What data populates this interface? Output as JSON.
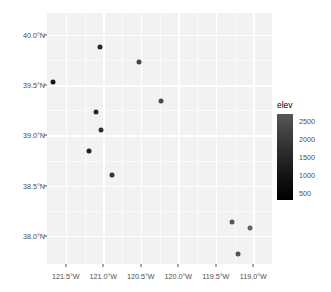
{
  "chart_data": {
    "type": "scatter",
    "title": "",
    "xlabel": "",
    "ylabel": "",
    "xlim": [
      -121.75,
      -118.75
    ],
    "ylim": [
      37.72,
      40.22
    ],
    "grid": true,
    "x_ticks": [
      {
        "value": -121.5,
        "label": "121.5°W"
      },
      {
        "value": -121.0,
        "label": "121.0°W"
      },
      {
        "value": -120.5,
        "label": "120.5°W"
      },
      {
        "value": -120.0,
        "label": "120.0°W"
      },
      {
        "value": -119.5,
        "label": "119.5°W"
      },
      {
        "value": -119.0,
        "label": "119.0°W"
      }
    ],
    "y_ticks": [
      {
        "value": 40.0,
        "label": "40.0°N"
      },
      {
        "value": 39.5,
        "label": "39.5°N"
      },
      {
        "value": 39.0,
        "label": "39.0°N"
      },
      {
        "value": 38.5,
        "label": "38.5°N"
      },
      {
        "value": 38.0,
        "label": "38.0°N"
      }
    ],
    "x_minor_ticks": [
      -121.25,
      -120.75,
      -120.25,
      -119.75,
      -119.25
    ],
    "y_minor_ticks": [
      39.75,
      39.25,
      38.75,
      38.25
    ],
    "points": [
      {
        "x": -121.04,
        "y": 39.88,
        "elev": 900,
        "color": "#2b2b2b"
      },
      {
        "x": -120.52,
        "y": 39.73,
        "elev": 1500,
        "color": "#444444"
      },
      {
        "x": -121.67,
        "y": 39.53,
        "elev": 500,
        "color": "#171717"
      },
      {
        "x": -120.23,
        "y": 39.34,
        "elev": 1700,
        "color": "#4a4a4a"
      },
      {
        "x": -121.1,
        "y": 39.23,
        "elev": 800,
        "color": "#262626"
      },
      {
        "x": -121.03,
        "y": 39.05,
        "elev": 1000,
        "color": "#2f2f2f"
      },
      {
        "x": -121.19,
        "y": 38.85,
        "elev": 700,
        "color": "#222222"
      },
      {
        "x": -120.88,
        "y": 38.61,
        "elev": 1200,
        "color": "#343434"
      },
      {
        "x": -119.29,
        "y": 38.14,
        "elev": 2100,
        "color": "#565656"
      },
      {
        "x": -119.05,
        "y": 38.08,
        "elev": 2400,
        "color": "#656565"
      },
      {
        "x": -119.21,
        "y": 37.82,
        "elev": 2000,
        "color": "#525252"
      },
      {
        "x": -119.68,
        "y": 37.58,
        "elev": 1400,
        "color": "#3d3d3d"
      }
    ]
  },
  "legend": {
    "title": "elev",
    "orientation": "vertical",
    "gradient_high_color": "#575757",
    "gradient_low_color": "#000000",
    "ticks": [
      {
        "value": 2500,
        "label": "2500"
      },
      {
        "value": 2000,
        "label": "2000"
      },
      {
        "value": 1500,
        "label": "1500"
      },
      {
        "value": 1000,
        "label": "1000"
      },
      {
        "value": 500,
        "label": "500"
      }
    ],
    "range": [
      300,
      2700
    ]
  },
  "theme": {
    "panel_background": "#f2f2f2",
    "gridline_color": "#ffffff",
    "axis_text_color": "#4d4d4d",
    "plot_background": "#ffffff"
  }
}
